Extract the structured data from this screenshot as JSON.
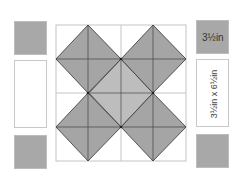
{
  "diagram": {
    "type": "quilt-block-layout",
    "colors": {
      "dark_fabric": "#a8a8a8",
      "light_center": "#bdbdbd",
      "background": "#ffffff",
      "grid_line": "#c4c4c4",
      "seam_line": "#333333"
    },
    "left_column": [
      {
        "kind": "square",
        "fill": "dark"
      },
      {
        "kind": "rectangle",
        "fill": "white"
      },
      {
        "kind": "square",
        "fill": "dark"
      }
    ],
    "right_column": [
      {
        "kind": "square",
        "fill": "dark",
        "label": "3½in"
      },
      {
        "kind": "rectangle",
        "fill": "white",
        "label": "3½in x 6½in"
      },
      {
        "kind": "square",
        "fill": "dark"
      }
    ],
    "block": {
      "grid": "2x2",
      "description": "Four dark diamonds arranged in an X around a lighter center diamond"
    }
  }
}
